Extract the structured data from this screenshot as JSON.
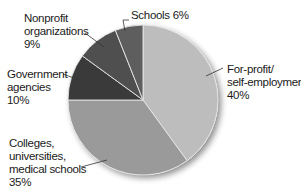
{
  "chart_data": {
    "type": "pie",
    "title": "",
    "start_angle_deg": 0,
    "direction": "clockwise",
    "slices": [
      {
        "label": "For-profit/\nself-employment",
        "value": 40,
        "value_label": "40%",
        "color": "#bdbdbd"
      },
      {
        "label": "Colleges,\nuniversities,\nmedical schools",
        "value": 35,
        "value_label": "35%",
        "color": "#9a9a9a"
      },
      {
        "label": "Government\nagencies",
        "value": 10,
        "value_label": "10%",
        "color": "#3a3a3a"
      },
      {
        "label": "Nonprofit\norganizations",
        "value": 9,
        "value_label": "9%",
        "color": "#4f4f4f"
      },
      {
        "label": "Schools",
        "value": 6,
        "value_label": "6%",
        "color": "#5e5e5e"
      }
    ],
    "legend": "none (direct labels with leader lines)"
  },
  "labels": {
    "forprofit": "For-profit/\nself-employment\n40%",
    "colleges": "Colleges,\nuniversities,\nmedical schools\n35%",
    "government": "Government\nagencies\n10%",
    "nonprofit": "Nonprofit\norganizations\n9%",
    "schools": "Schools 6%"
  }
}
